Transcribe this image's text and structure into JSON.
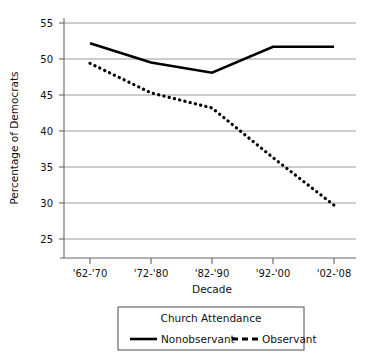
{
  "chart_data": {
    "type": "line",
    "title": "",
    "xlabel": "Decade",
    "ylabel": "Percentage of Democrats",
    "categories": [
      "'62-'70",
      "'72-'80",
      "'82-'90",
      "'92-'00",
      "'02-'08"
    ],
    "ylim": [
      23.5,
      56.5
    ],
    "yticks": [
      25,
      30,
      35,
      40,
      45,
      50,
      55
    ],
    "ytick_labels": [
      "25",
      "30",
      "35",
      "40",
      "45",
      "50",
      "55"
    ],
    "grid": "horizontal",
    "legend_position": "below",
    "legend_title": "Church Attendance",
    "series": [
      {
        "name": "Nonobservant",
        "style": "solid",
        "color": "#000000",
        "values": [
          52.2,
          49.5,
          48.1,
          51.7,
          51.7
        ]
      },
      {
        "name": "Observant",
        "style": "dotted",
        "color": "#000000",
        "values": [
          49.4,
          45.3,
          43.2,
          36.3,
          29.7
        ]
      }
    ]
  },
  "axes": {
    "y_title": "Percentage of Democrats",
    "x_title": "Decade",
    "y_tick_25": "25",
    "y_tick_30": "30",
    "y_tick_35": "35",
    "y_tick_40": "40",
    "y_tick_45": "45",
    "y_tick_50": "50",
    "y_tick_55": "55",
    "x_tick_0": "'62-'70",
    "x_tick_1": "'72-'80",
    "x_tick_2": "'82-'90",
    "x_tick_3": "'92-'00",
    "x_tick_4": "'02-'08"
  },
  "legend": {
    "title": "Church Attendance",
    "item_solid_label": "Nonobservant",
    "item_dashed_label": "Observant"
  },
  "colors": {
    "line": "#000000",
    "grid": "#999999",
    "axis": "#666666",
    "background": "#ffffff"
  }
}
